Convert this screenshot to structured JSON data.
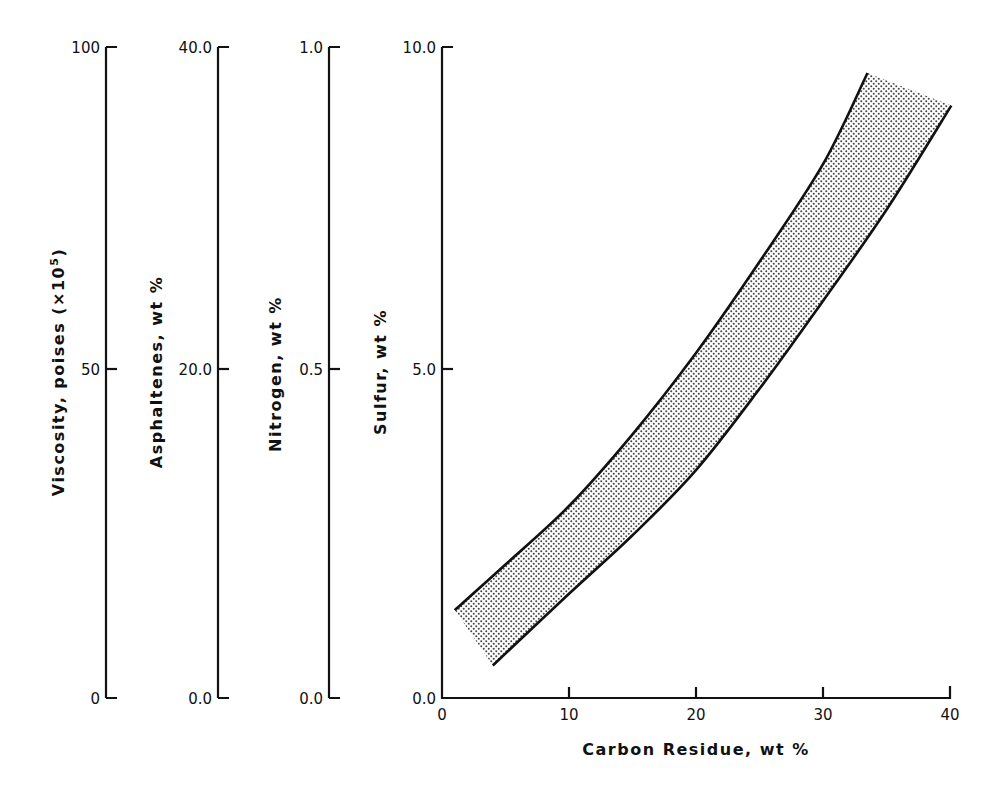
{
  "chart_data": {
    "type": "area",
    "title": "",
    "xlabel": "Carbon Residue, wt %",
    "x_ticks": [
      "0",
      "10",
      "20",
      "30",
      "40"
    ],
    "xlim": [
      0,
      40
    ],
    "grid": false,
    "legend": null,
    "y_axes": [
      {
        "id": "viscosity",
        "label": "Viscosity, poises (×10",
        "label_sup": "5",
        "label_end": ")",
        "ticks": [
          "0",
          "50",
          "100"
        ],
        "range": [
          0,
          100
        ]
      },
      {
        "id": "asphaltenes",
        "label": "Asphaltenes, wt %",
        "ticks": [
          "0.0",
          "20.0",
          "40.0"
        ],
        "range": [
          0,
          40
        ]
      },
      {
        "id": "nitrogen",
        "label": "Nitrogen, wt %",
        "ticks": [
          "0.0",
          "0.5",
          "1.0"
        ],
        "range": [
          0,
          1
        ]
      },
      {
        "id": "sulfur",
        "label": "Sulfur, wt %",
        "ticks": [
          "0.0",
          "5.0",
          "10.0"
        ],
        "range": [
          0,
          10
        ]
      }
    ],
    "series": [
      {
        "name": "upper bound",
        "x": [
          1,
          5,
          10,
          15,
          20,
          25,
          30,
          33.5
        ],
        "y": [
          1.35,
          2.05,
          2.95,
          4.05,
          5.3,
          6.7,
          8.2,
          9.6
        ]
      },
      {
        "name": "lower bound",
        "x": [
          4,
          10,
          15,
          20,
          25,
          30,
          35,
          40.1
        ],
        "y": [
          0.5,
          1.6,
          2.5,
          3.5,
          4.75,
          6.1,
          7.5,
          9.1
        ]
      }
    ],
    "band_fill": "stippled gray region between upper and lower bounds"
  },
  "colors": {
    "ink": "#111111",
    "stipple": "#555555",
    "background": "#ffffff"
  }
}
